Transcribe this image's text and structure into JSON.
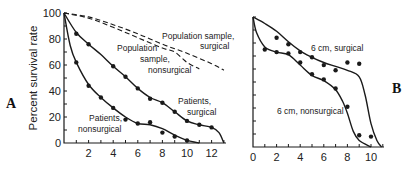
{
  "chart_data": [
    {
      "panel": "A",
      "type": "line",
      "title": "",
      "xlabel": "",
      "ylabel": "Percent survival rate",
      "xlim": [
        0,
        13
      ],
      "ylim": [
        0,
        100
      ],
      "x_ticks": [
        2,
        4,
        6,
        8,
        10,
        12
      ],
      "y_ticks": [
        0,
        20,
        40,
        60,
        80,
        100
      ],
      "grid": false,
      "legend": "inline labels",
      "series": [
        {
          "name": "Population sample, surgical",
          "style": "dashed",
          "curve": [
            [
              0,
              100
            ],
            [
              2,
              97
            ],
            [
              4,
              91
            ],
            [
              6,
              84
            ],
            [
              8,
              76
            ],
            [
              10,
              69
            ],
            [
              12,
              61
            ],
            [
              13,
              56
            ]
          ],
          "points": []
        },
        {
          "name": "Population sample, nonsurgical",
          "style": "dashed",
          "curve": [
            [
              0,
              100
            ],
            [
              2,
              96
            ],
            [
              4,
              89
            ],
            [
              6,
              81
            ],
            [
              8,
              73
            ],
            [
              9,
              70
            ],
            [
              10,
              62
            ],
            [
              11,
              57
            ]
          ],
          "points": []
        },
        {
          "name": "Patients, surgical",
          "style": "solid",
          "curve": [
            [
              0,
              100
            ],
            [
              1,
              85
            ],
            [
              2,
              76
            ],
            [
              3,
              68
            ],
            [
              4,
              59
            ],
            [
              5,
              51
            ],
            [
              6,
              42
            ],
            [
              7,
              35
            ],
            [
              8,
              31
            ],
            [
              9,
              24
            ],
            [
              10,
              17
            ],
            [
              11,
              14
            ],
            [
              12,
              12
            ],
            [
              12.6,
              8
            ],
            [
              13,
              0
            ]
          ],
          "points": [
            [
              1,
              84
            ],
            [
              2,
              76
            ],
            [
              4,
              59
            ],
            [
              5,
              51
            ],
            [
              6,
              42
            ],
            [
              7,
              34
            ],
            [
              8,
              31
            ],
            [
              9,
              24
            ],
            [
              10,
              17
            ],
            [
              11,
              14
            ],
            [
              12,
              12
            ]
          ]
        },
        {
          "name": "Patients, nonsurgical",
          "style": "solid",
          "curve": [
            [
              0,
              100
            ],
            [
              0.5,
              75
            ],
            [
              1,
              62
            ],
            [
              2,
              45
            ],
            [
              3,
              35
            ],
            [
              4,
              27
            ],
            [
              5,
              20
            ],
            [
              6,
              15
            ],
            [
              7,
              14
            ],
            [
              8,
              11
            ],
            [
              9,
              6
            ],
            [
              10,
              2
            ],
            [
              11,
              0
            ]
          ],
          "points": [
            [
              1,
              62
            ],
            [
              2,
              44
            ],
            [
              3,
              35
            ],
            [
              4,
              27
            ],
            [
              5,
              18
            ],
            [
              6,
              15
            ],
            [
              7,
              16
            ],
            [
              8,
              8
            ],
            [
              9,
              5
            ],
            [
              10,
              2
            ]
          ]
        }
      ],
      "annotations": [
        "Population sample, surgical",
        "Population sample, nonsurgical",
        "Patients, surgical",
        "Patients, nonsurgical"
      ]
    },
    {
      "panel": "B",
      "type": "line",
      "title": "",
      "xlabel": "",
      "ylabel": "",
      "xlim": [
        0,
        11
      ],
      "ylim": [
        0,
        100
      ],
      "x_ticks": [
        0,
        2,
        4,
        6,
        8,
        10
      ],
      "grid": false,
      "legend": "inline labels",
      "series": [
        {
          "name": "6 cm, surgical",
          "style": "solid",
          "curve": [
            [
              0,
              100
            ],
            [
              1,
              95
            ],
            [
              2,
              89
            ],
            [
              3,
              81
            ],
            [
              4,
              74
            ],
            [
              5,
              69
            ],
            [
              6,
              65
            ],
            [
              7,
              62
            ],
            [
              8,
              59
            ],
            [
              9,
              54
            ],
            [
              9.5,
              40
            ],
            [
              10,
              18
            ],
            [
              10.5,
              5
            ],
            [
              10.9,
              0
            ]
          ],
          "points": [
            [
              2,
              84
            ],
            [
              3,
              79
            ],
            [
              4,
              73
            ],
            [
              5,
              69
            ],
            [
              6,
              63
            ],
            [
              7,
              59
            ],
            [
              8,
              65
            ],
            [
              9,
              64
            ],
            [
              10,
              8
            ]
          ]
        },
        {
          "name": "6 cm, nonsurgical",
          "style": "solid",
          "curve": [
            [
              0,
              100
            ],
            [
              0.3,
              88
            ],
            [
              1,
              77
            ],
            [
              2,
              73
            ],
            [
              3,
              71
            ],
            [
              4,
              63
            ],
            [
              5,
              55
            ],
            [
              6,
              51
            ],
            [
              7,
              44
            ],
            [
              7.6,
              35
            ],
            [
              8,
              26
            ],
            [
              8.5,
              12
            ],
            [
              9,
              5
            ],
            [
              10,
              0
            ]
          ],
          "points": [
            [
              1,
              75
            ],
            [
              2,
              73
            ],
            [
              3,
              72
            ],
            [
              4,
              65
            ],
            [
              5,
              56
            ],
            [
              6,
              52
            ],
            [
              7,
              45
            ],
            [
              8,
              31
            ],
            [
              9,
              9
            ]
          ]
        }
      ],
      "annotations": [
        "6 cm, surgical",
        "6 cm, nonsurgical"
      ]
    }
  ],
  "labels": {
    "panel_a": "A",
    "panel_b": "B",
    "y_axis": "Percent survival rate",
    "pop_surgical_1": "Population sample,",
    "pop_surgical_2": "surgical",
    "pop_nonsurg_1": "Population",
    "pop_nonsurg_2": "sample,",
    "pop_nonsurg_3": "nonsurgical",
    "pat_surgical_1": "Patients,",
    "pat_surgical_2": "surgical",
    "pat_nonsurg_1": "Patients,",
    "pat_nonsurg_2": "nonsurgical",
    "b_surgical": "6 cm, surgical",
    "b_nonsurgical": "6 cm, nonsurgical"
  }
}
